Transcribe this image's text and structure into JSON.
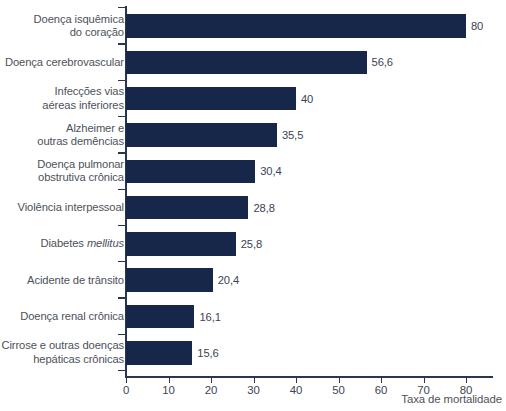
{
  "chart_data": {
    "type": "bar",
    "orientation": "horizontal",
    "title": "",
    "xlabel": "Taxa de mortalidade",
    "ylabel": "",
    "xlim": [
      0,
      85
    ],
    "xticks": [
      0,
      10,
      20,
      30,
      40,
      50,
      60,
      70,
      80
    ],
    "xtick_labels": [
      "0",
      "10",
      "20",
      "30",
      "40",
      "50",
      "60",
      "70",
      "80"
    ],
    "grid": false,
    "legend": null,
    "bar_color": "#17274a",
    "text_color": "#4a4f57",
    "categories": [
      "Doença isquêmica do coração",
      "Doença cerebrovascular",
      "Infecções vias aéreas inferiores",
      "Alzheimer e outras demências",
      "Doença pulmonar obstrutiva crônica",
      "Violência interpessoal",
      "Diabetes mellitus",
      "Acidente de trânsito",
      "Doença renal crônica",
      "Cirrose e outras doenças hepáticas crônicas"
    ],
    "values": [
      80,
      56.6,
      40,
      35.5,
      30.4,
      28.8,
      25.8,
      20.4,
      16.1,
      15.6
    ],
    "value_labels": [
      "80",
      "56,6",
      "40",
      "35,5",
      "30,4",
      "28,8",
      "25,8",
      "20,4",
      "16,1",
      "15,6"
    ]
  },
  "bars": [
    {
      "lines": [
        "Doença isquêmica",
        "do coração"
      ],
      "italic_line_index": -1,
      "value": 80,
      "value_label": "80"
    },
    {
      "lines": [
        "Doença cerebrovascular"
      ],
      "italic_line_index": -1,
      "value": 56.6,
      "value_label": "56,6"
    },
    {
      "lines": [
        "Infecções vias",
        "aéreas inferiores"
      ],
      "italic_line_index": -1,
      "value": 40,
      "value_label": "40"
    },
    {
      "lines": [
        "Alzheimer e",
        "outras demências"
      ],
      "italic_line_index": -1,
      "value": 35.5,
      "value_label": "35,5"
    },
    {
      "lines": [
        "Doença pulmonar",
        "obstrutiva crônica"
      ],
      "italic_line_index": -1,
      "value": 30.4,
      "value_label": "30,4"
    },
    {
      "lines": [
        "Violência interpessoal"
      ],
      "italic_line_index": -1,
      "value": 28.8,
      "value_label": "28,8"
    },
    {
      "lines": [
        "Diabetes ",
        "mellitus"
      ],
      "italic_line_index": 1,
      "inline": true,
      "value": 25.8,
      "value_label": "25,8"
    },
    {
      "lines": [
        "Acidente de trânsito"
      ],
      "italic_line_index": -1,
      "value": 20.4,
      "value_label": "20,4"
    },
    {
      "lines": [
        "Doença renal crônica"
      ],
      "italic_line_index": -1,
      "value": 16.1,
      "value_label": "16,1"
    },
    {
      "lines": [
        "Cirrose e outras doenças",
        "hepáticas crônicas"
      ],
      "italic_line_index": -1,
      "value": 15.6,
      "value_label": "15,6"
    }
  ],
  "axis": {
    "x_title": "Taxa de mortalidade",
    "x_tick_labels": [
      "0",
      "10",
      "20",
      "30",
      "40",
      "50",
      "60",
      "70",
      "80"
    ]
  }
}
